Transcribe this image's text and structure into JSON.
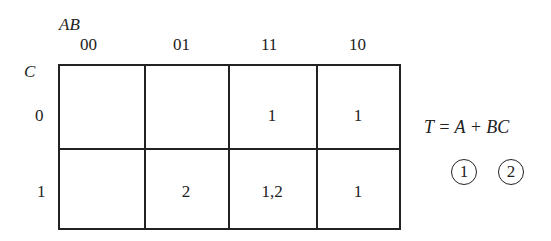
{
  "kmap": {
    "row_var": "C",
    "col_vars": "AB",
    "col_headers": [
      "00",
      "01",
      "11",
      "10"
    ],
    "row_headers": [
      "0",
      "1"
    ],
    "cells": [
      [
        "",
        "",
        "1",
        "1"
      ],
      [
        "",
        "2",
        "1,2",
        "1"
      ]
    ]
  },
  "expression": {
    "text": "T = A + BC",
    "term_labels": [
      "1",
      "2"
    ]
  }
}
